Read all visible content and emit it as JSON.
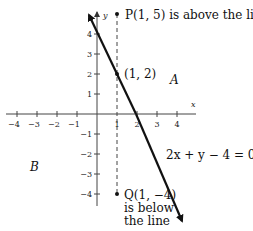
{
  "figure": {
    "axes": {
      "x_label": "x",
      "y_label": "y",
      "x_ticks": [
        {
          "value": -4,
          "label": "−4"
        },
        {
          "value": -3,
          "label": "−3"
        },
        {
          "value": -2,
          "label": "−2"
        },
        {
          "value": -1,
          "label": "−1"
        },
        {
          "value": 1,
          "label": "1"
        },
        {
          "value": 2,
          "label": "2"
        },
        {
          "value": 3,
          "label": "3"
        },
        {
          "value": 4,
          "label": "4"
        }
      ],
      "y_ticks": [
        {
          "value": 4,
          "label": "4"
        },
        {
          "value": 3,
          "label": "3"
        },
        {
          "value": 2,
          "label": "2"
        },
        {
          "value": 1,
          "label": "1"
        },
        {
          "value": -1,
          "label": "−1"
        },
        {
          "value": -2,
          "label": "−2"
        },
        {
          "value": -3,
          "label": "−3"
        },
        {
          "value": -4,
          "label": "−4"
        }
      ]
    },
    "line": {
      "equation": "2x + y − 4 = 0"
    },
    "points": {
      "P": {
        "label": "P(1, 5) is above the line"
      },
      "mid": {
        "label": "(1, 2)"
      },
      "Q": {
        "label": "Q(1, −4)",
        "note_line1": "is below",
        "note_line2": "the line"
      }
    },
    "regions": {
      "A": "A",
      "B": "B"
    }
  }
}
